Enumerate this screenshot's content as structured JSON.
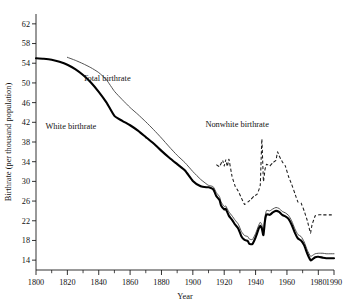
{
  "figure": {
    "title_partial": "",
    "xlabel": "Year",
    "ylabel": "Birthrate (per thousand population)"
  },
  "series_labels": {
    "total": "Total birthrate",
    "white": "White birthrate",
    "nonwhite": "Nonwhite birthrate"
  },
  "chart_data": {
    "type": "line",
    "title": "",
    "xlabel": "Year",
    "ylabel": "Birthrate (per thousand population)",
    "xlim": [
      1800,
      1990
    ],
    "ylim": [
      12,
      64
    ],
    "grid": false,
    "legend": "inline-annotations",
    "xticks": [
      1800,
      1820,
      1840,
      1860,
      1880,
      1900,
      1920,
      1940,
      1960,
      1980,
      1990
    ],
    "xtick_labels": [
      "1800",
      "1820",
      "1840",
      "1860",
      "1880",
      "1900",
      "1920",
      "1940",
      "1960",
      "1980",
      "1990"
    ],
    "xticks_minor": [
      1810,
      1830,
      1850,
      1870,
      1890,
      1910,
      1930,
      1950,
      1970
    ],
    "yticks": [
      14,
      18,
      22,
      26,
      30,
      34,
      38,
      42,
      46,
      50,
      54,
      58,
      62
    ],
    "ytick_labels": [
      "14",
      "18",
      "22",
      "26",
      "30",
      "34",
      "38",
      "42",
      "46",
      "50",
      "54",
      "58",
      "62"
    ],
    "series": [
      {
        "name": "White birthrate",
        "style": "solid-thick",
        "color": "#000000",
        "x": [
          1800,
          1805,
          1810,
          1815,
          1820,
          1825,
          1830,
          1835,
          1840,
          1845,
          1850,
          1855,
          1860,
          1865,
          1870,
          1875,
          1880,
          1885,
          1890,
          1895,
          1900,
          1905,
          1909,
          1910,
          1913,
          1915,
          1917,
          1918,
          1920,
          1921,
          1923,
          1925,
          1927,
          1929,
          1931,
          1933,
          1935,
          1936,
          1938,
          1940,
          1942,
          1943,
          1944,
          1945,
          1946,
          1947,
          1949,
          1951,
          1953,
          1955,
          1957,
          1959,
          1961,
          1963,
          1965,
          1967,
          1969,
          1971,
          1973,
          1975,
          1976,
          1978,
          1980,
          1983,
          1985,
          1988,
          1990
        ],
        "y": [
          55.0,
          54.9,
          54.7,
          54.3,
          53.7,
          52.8,
          51.6,
          50.1,
          48.2,
          46.0,
          43.3,
          42.3,
          41.4,
          40.3,
          39.0,
          37.7,
          36.2,
          34.8,
          33.5,
          32.2,
          30.1,
          29.0,
          28.8,
          28.8,
          28.4,
          27.0,
          26.2,
          25.1,
          24.3,
          24.4,
          23.0,
          22.2,
          21.2,
          20.4,
          18.8,
          18.1,
          17.9,
          17.3,
          17.3,
          18.6,
          20.4,
          21.0,
          20.4,
          19.1,
          22.0,
          23.3,
          23.2,
          23.7,
          24.0,
          23.8,
          23.2,
          22.9,
          22.4,
          21.2,
          19.6,
          18.4,
          18.0,
          17.0,
          15.3,
          14.0,
          14.1,
          14.6,
          14.7,
          14.5,
          14.4,
          14.4,
          14.4
        ]
      },
      {
        "name": "Total birthrate",
        "style": "solid-thin",
        "color": "#4a4a4a",
        "x": [
          1820,
          1825,
          1830,
          1835,
          1840,
          1845,
          1850,
          1855,
          1860,
          1865,
          1870,
          1875,
          1880,
          1885,
          1890,
          1895,
          1900,
          1905,
          1909,
          1910,
          1913,
          1915,
          1917,
          1918,
          1920,
          1921,
          1923,
          1925,
          1927,
          1929,
          1931,
          1933,
          1935,
          1936,
          1938,
          1940,
          1942,
          1943,
          1944,
          1945,
          1946,
          1947,
          1949,
          1951,
          1953,
          1955,
          1957,
          1959,
          1961,
          1963,
          1965,
          1967,
          1969,
          1971,
          1973,
          1975,
          1976,
          1978,
          1980,
          1983,
          1985,
          1988,
          1990
        ],
        "y": [
          55.2,
          54.6,
          53.9,
          53.1,
          52.1,
          50.6,
          48.3,
          46.6,
          45.0,
          43.6,
          42.1,
          40.5,
          38.8,
          37.0,
          35.3,
          33.8,
          32.0,
          30.4,
          29.4,
          29.2,
          28.9,
          27.7,
          26.9,
          25.8,
          24.9,
          25.0,
          23.8,
          23.0,
          22.1,
          21.3,
          19.8,
          19.0,
          18.8,
          18.3,
          18.2,
          19.4,
          21.1,
          21.7,
          21.2,
          19.9,
          22.8,
          24.1,
          24.0,
          24.4,
          24.7,
          24.5,
          23.9,
          23.6,
          23.1,
          22.0,
          20.4,
          19.2,
          18.8,
          17.7,
          16.0,
          14.8,
          14.9,
          15.3,
          15.4,
          15.4,
          15.3,
          15.3,
          15.3
        ]
      },
      {
        "name": "Nonwhite birthrate",
        "style": "dashed",
        "color": "#1b1b1b",
        "x": [
          1915,
          1917,
          1919,
          1920,
          1921,
          1922,
          1923,
          1925,
          1927,
          1929,
          1931,
          1933,
          1935,
          1937,
          1939,
          1941,
          1943,
          1944,
          1945,
          1946,
          1947,
          1949,
          1951,
          1953,
          1954,
          1955,
          1957,
          1959,
          1961,
          1963,
          1965,
          1967,
          1969,
          1971,
          1973,
          1975,
          1976,
          1978,
          1980,
          1983,
          1985,
          1988,
          1990
        ],
        "y": [
          33.4,
          33.0,
          34.3,
          33.1,
          34.4,
          33.0,
          34.5,
          31.0,
          29.0,
          28.0,
          26.6,
          25.3,
          25.8,
          26.3,
          27.0,
          27.4,
          29.3,
          38.6,
          30.0,
          32.4,
          33.5,
          33.1,
          33.8,
          34.3,
          36.0,
          35.2,
          34.0,
          33.1,
          31.0,
          29.4,
          27.6,
          25.8,
          25.6,
          24.0,
          22.0,
          19.5,
          21.2,
          23.0,
          23.2,
          23.2,
          23.2,
          23.2,
          23.2
        ]
      }
    ]
  },
  "annotations": [
    {
      "text": "Total birthrate",
      "x": 1830,
      "y": 50.4
    },
    {
      "text": "White birthrate",
      "x": 1806,
      "y": 40.6
    },
    {
      "text": "Nonwhite birthrate",
      "x": 1908,
      "y": 41.1
    }
  ]
}
